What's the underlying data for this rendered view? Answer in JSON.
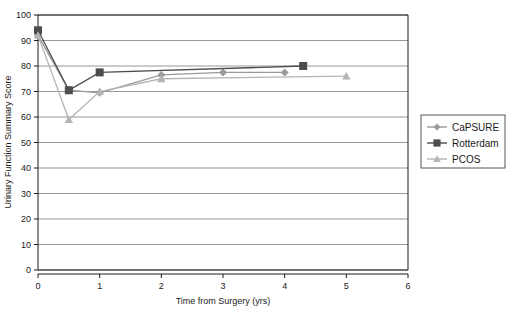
{
  "chart_data": {
    "type": "line",
    "title": "",
    "xlabel": "Time from Surgery (yrs)",
    "ylabel": "Urinary Function Summary Score",
    "xlim": [
      0,
      6
    ],
    "ylim": [
      0,
      100
    ],
    "xticks": [
      "0",
      "1",
      "2",
      "3",
      "4",
      "5",
      "6"
    ],
    "xtick_values": [
      0,
      1,
      2,
      3,
      4,
      5,
      6
    ],
    "yticks": [
      "0",
      "10",
      "20",
      "30",
      "40",
      "50",
      "60",
      "70",
      "80",
      "90",
      "100"
    ],
    "ytick_values": [
      0,
      10,
      20,
      30,
      40,
      50,
      60,
      70,
      80,
      90,
      100
    ],
    "grid": "horizontal",
    "legend_position": "right-outside",
    "series": [
      {
        "name": "CaPSURE",
        "marker": "diamond",
        "color": "#9a9a9a",
        "x": [
          0,
          0.5,
          1,
          2,
          3,
          4
        ],
        "values": [
          92,
          70.5,
          69.5,
          76.5,
          77.5,
          77.5
        ]
      },
      {
        "name": "Rotterdam",
        "marker": "square",
        "color": "#4d4d4d",
        "x": [
          0,
          0.5,
          1,
          4.3
        ],
        "values": [
          94,
          70.5,
          77.5,
          80
        ]
      },
      {
        "name": "PCOS",
        "marker": "triangle",
        "color": "#b5b5b5",
        "x": [
          0,
          0.5,
          1,
          2,
          5
        ],
        "values": [
          92,
          59,
          70,
          75,
          76
        ]
      }
    ]
  },
  "legend": {
    "entries": [
      {
        "label": "CaPSURE"
      },
      {
        "label": "Rotterdam"
      },
      {
        "label": "PCOS"
      }
    ]
  },
  "colors": {
    "axis": "#1a1a1a",
    "grid": "#6b6b6b",
    "background": "#ffffff",
    "capsure": "#9a9a9a",
    "rotterdam": "#4d4d4d",
    "pcos": "#b5b5b5"
  }
}
